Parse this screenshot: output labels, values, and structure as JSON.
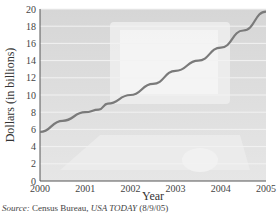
{
  "chart_data": {
    "type": "line",
    "title": "",
    "xlabel": "Year",
    "ylabel": "Dollars (in billions)",
    "x": [
      2000,
      2000.5,
      2001,
      2001.3,
      2001.5,
      2002,
      2002.5,
      2003,
      2003.5,
      2004,
      2004.5,
      2005
    ],
    "series": [
      {
        "name": "Sales",
        "values": [
          5.7,
          7.0,
          8.0,
          8.3,
          9.0,
          10.0,
          11.3,
          12.8,
          14.0,
          15.5,
          17.5,
          19.7
        ]
      }
    ],
    "xticks": [
      "2000",
      "2001",
      "2002",
      "2003",
      "2004",
      "2005"
    ],
    "yticks": [
      "0",
      "2",
      "4",
      "6",
      "8",
      "10",
      "12",
      "14",
      "16",
      "18",
      "20"
    ],
    "xlim": [
      2000,
      2005
    ],
    "ylim": [
      0,
      20
    ],
    "grid": true,
    "legend": "none",
    "colors": {
      "line": "#7a7a7a",
      "plot_bg": "#d9d9d9",
      "grid": "#f2f2f2",
      "axis": "#555555"
    }
  },
  "source": {
    "label": "Source:",
    "text1": " Census Bureau, ",
    "publication": "USA TODAY",
    "date": " (8/9/05)"
  }
}
